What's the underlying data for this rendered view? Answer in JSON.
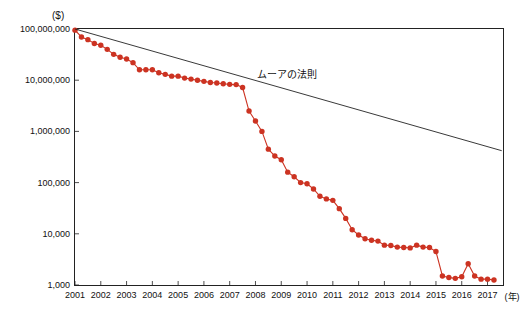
{
  "chart_data": {
    "type": "line",
    "title": "",
    "subtitle": "",
    "unit_label": "($)",
    "xlabel": "(年)",
    "ylabel": "",
    "ylim": [
      1000,
      100000000
    ],
    "yscale": "log",
    "grid": false,
    "legend_position": "none",
    "annotations": [
      {
        "text": "ムーアの法則",
        "x": 2008.1,
        "y": 9000000
      }
    ],
    "yticks": [
      "100,000,000",
      "10,000,000",
      "1,000,000",
      "100,000",
      "10,000",
      "1,000"
    ],
    "ytick_values": [
      100000000,
      10000000,
      1000000,
      100000,
      10000,
      1000
    ],
    "xticks": [
      "2001",
      "2002",
      "2003",
      "2004",
      "2005",
      "2006",
      "2007",
      "2008",
      "2009",
      "2010",
      "2011",
      "2012",
      "2013",
      "2014",
      "2015",
      "2016",
      "2017"
    ],
    "xlim": [
      2001,
      2017.6
    ],
    "series": [
      {
        "name": "sequencing-cost",
        "color": "#cc3322",
        "marker": "circle",
        "x": [
          2001.0,
          2001.25,
          2001.5,
          2001.75,
          2002.0,
          2002.25,
          2002.5,
          2002.75,
          2003.0,
          2003.25,
          2003.5,
          2003.75,
          2004.0,
          2004.25,
          2004.5,
          2004.75,
          2005.0,
          2005.25,
          2005.5,
          2005.75,
          2006.0,
          2006.25,
          2006.5,
          2006.75,
          2007.0,
          2007.25,
          2007.5,
          2007.75,
          2008.0,
          2008.25,
          2008.5,
          2008.75,
          2009.0,
          2009.25,
          2009.5,
          2009.75,
          2010.0,
          2010.25,
          2010.5,
          2010.75,
          2011.0,
          2011.25,
          2011.5,
          2011.75,
          2012.0,
          2012.25,
          2012.5,
          2012.75,
          2013.0,
          2013.25,
          2013.5,
          2013.75,
          2014.0,
          2014.25,
          2014.5,
          2014.75,
          2015.0,
          2015.25,
          2015.5,
          2015.75,
          2016.0,
          2016.25,
          2016.5,
          2016.75,
          2017.0,
          2017.25
        ],
        "y": [
          95000000,
          70000000,
          62000000,
          52000000,
          48000000,
          40000000,
          32000000,
          28000000,
          26000000,
          22000000,
          16000000,
          16000000,
          16000000,
          14000000,
          13000000,
          12000000,
          12000000,
          11000000,
          10500000,
          10000000,
          9500000,
          9000000,
          8800000,
          8500000,
          8300000,
          8200000,
          7200000,
          2500000,
          1600000,
          1000000,
          450000,
          330000,
          280000,
          160000,
          130000,
          100000,
          95000,
          75000,
          54000,
          48000,
          45000,
          31000,
          20000,
          12000,
          9500,
          8000,
          7500,
          7200,
          6000,
          5900,
          5500,
          5400,
          5300,
          6000,
          5500,
          5400,
          4500,
          1500,
          1400,
          1350,
          1450,
          2600,
          1500,
          1300,
          1300,
          1250
        ]
      },
      {
        "name": "moores-law-line",
        "color": "#222222",
        "marker": "none",
        "x": [
          2001.0,
          2017.55
        ],
        "y": [
          100000000,
          420000
        ]
      }
    ]
  }
}
